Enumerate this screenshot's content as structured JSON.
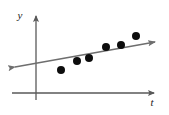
{
  "figure": {
    "kind": "scatter-plot-with-trend-line",
    "width": 169,
    "height": 115,
    "background_color": "#ffffff"
  },
  "axes": {
    "x_axis": {
      "label": "t",
      "label_x": 152,
      "label_y": 106,
      "line": {
        "x1": 12,
        "y1": 93,
        "x2": 156,
        "y2": 93
      },
      "arrow_end": "right",
      "color": "#595959"
    },
    "y_axis": {
      "label": "y",
      "label_x": 20,
      "label_y": 19,
      "line": {
        "x1": 36,
        "y1": 100,
        "x2": 36,
        "y2": 14
      },
      "arrow_end": "top",
      "color": "#595959"
    }
  },
  "trend_line": {
    "name": "fitted-trend-line",
    "color": "#6e6e6e",
    "width": 1.6,
    "arrow_ends": "both",
    "x1": 15,
    "y1": 67,
    "x2": 155,
    "y2": 42
  },
  "chart_data": {
    "type": "scatter",
    "title": "",
    "xlabel": "t",
    "ylabel": "y",
    "grid": false,
    "legend": null,
    "axis_origin_px": {
      "x": 36,
      "y": 93
    },
    "xlim_px": [
      12,
      156
    ],
    "ylim_px": [
      100,
      14
    ],
    "marker": {
      "shape": "circle",
      "color": "#0d0d0d",
      "radius_px": 4
    },
    "points_px": [
      {
        "x": 61,
        "y": 70
      },
      {
        "x": 77,
        "y": 61
      },
      {
        "x": 89,
        "y": 58
      },
      {
        "x": 106,
        "y": 47
      },
      {
        "x": 121,
        "y": 45
      },
      {
        "x": 136,
        "y": 36
      }
    ],
    "series": [
      {
        "name": "observations",
        "x": [
          25,
          41,
          53,
          70,
          85,
          100
        ],
        "values": [
          23,
          32,
          35,
          46,
          48,
          57
        ]
      }
    ],
    "trend": {
      "name": "trend-line",
      "x": [
        -21,
        119
      ],
      "values": [
        26,
        51
      ],
      "slope": 0.179,
      "description": "positive linear trend"
    }
  }
}
